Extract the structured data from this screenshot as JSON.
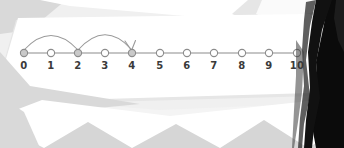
{
  "scene": {
    "kind": "number-line-illustration",
    "description": "Number line 0 to 10 with two curved skip-count arrows",
    "background_color": "#f0f0f0",
    "panel_color": "#ffffff",
    "panel_shadow_color": "#e3e3e3",
    "chevron_color": "#d6d6d6",
    "silhouette_color": "#0b0b0b"
  },
  "number_line": {
    "axis_color": "#8c8c8c",
    "node_stroke_color": "#8c8c8c",
    "node_fill_default": "#ffffff",
    "node_fill_marked": "#c9c9c9",
    "label_color": "#3a3a3a",
    "start_x": 24,
    "end_x": 297,
    "axis_y": 53,
    "label_y": 60,
    "ticks": [
      {
        "label": "0",
        "x": 24,
        "marked": true
      },
      {
        "label": "1",
        "x": 51,
        "marked": false
      },
      {
        "label": "2",
        "x": 78,
        "marked": true
      },
      {
        "label": "3",
        "x": 105,
        "marked": false
      },
      {
        "label": "4",
        "x": 132,
        "marked": true
      },
      {
        "label": "5",
        "x": 160,
        "marked": false
      },
      {
        "label": "6",
        "x": 187,
        "marked": false
      },
      {
        "label": "7",
        "x": 214,
        "marked": false
      },
      {
        "label": "8",
        "x": 242,
        "marked": false
      },
      {
        "label": "9",
        "x": 269,
        "marked": false
      },
      {
        "label": "10",
        "x": 297,
        "marked": false
      }
    ],
    "jumps": [
      {
        "from_label": "0",
        "to_label": "2",
        "from_x": 24,
        "to_x": 78,
        "peak_y": 27,
        "arrowhead": false
      },
      {
        "from_label": "2",
        "to_label": "4",
        "from_x": 78,
        "to_x": 132,
        "peak_y": 26,
        "arrowhead": true
      }
    ],
    "arrow_color": "#9a9a9a"
  }
}
